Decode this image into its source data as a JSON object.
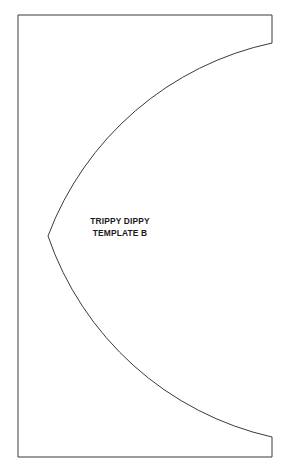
{
  "document": {
    "background_color": "#ffffff",
    "width": 285,
    "height": 471
  },
  "template": {
    "name": "trippy-dippy-template-b",
    "stroke_color": "#3a3a3a",
    "fill_color": "#ffffff",
    "stroke_width": 1,
    "label": {
      "line1": "TRIPPY DIPPY",
      "line2": "TEMPLATE B"
    },
    "geometry": {
      "rect_left": 18,
      "rect_top": 15,
      "rect_right": 272,
      "rect_bottom": 457,
      "arc_top_point_x": 272,
      "arc_top_point_y": 43,
      "arc_bottom_point_x": 272,
      "arc_bottom_point_y": 437,
      "arc_apex_x": 48,
      "arc_apex_y": 236,
      "arc_radius": 308,
      "arc_sweep": "counterclockwise"
    }
  }
}
